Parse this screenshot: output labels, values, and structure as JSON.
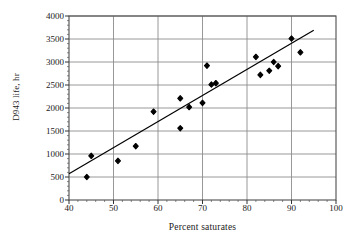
{
  "chart_data": {
    "type": "scatter",
    "title": "",
    "xlabel": "Percent saturates",
    "ylabel": "D943 life, hr",
    "xlim": [
      40,
      100
    ],
    "ylim": [
      0,
      4000
    ],
    "xticks": [
      40,
      50,
      60,
      70,
      80,
      90,
      100
    ],
    "yticks": [
      0,
      500,
      1000,
      1500,
      2000,
      2500,
      3000,
      3500,
      4000
    ],
    "grid": "horizontal-and-vertical",
    "legend": "none",
    "marker": "filled-diamond",
    "marker_color": "#000000",
    "line_color": "#000000",
    "points": [
      {
        "x": 44,
        "y": 500
      },
      {
        "x": 45,
        "y": 960
      },
      {
        "x": 51,
        "y": 850
      },
      {
        "x": 55,
        "y": 1170
      },
      {
        "x": 59,
        "y": 1920
      },
      {
        "x": 65,
        "y": 1560
      },
      {
        "x": 65,
        "y": 2210
      },
      {
        "x": 67,
        "y": 2020
      },
      {
        "x": 70,
        "y": 2110
      },
      {
        "x": 71,
        "y": 2920
      },
      {
        "x": 72,
        "y": 2510
      },
      {
        "x": 73,
        "y": 2540
      },
      {
        "x": 82,
        "y": 3110
      },
      {
        "x": 83,
        "y": 2720
      },
      {
        "x": 85,
        "y": 2810
      },
      {
        "x": 86,
        "y": 3000
      },
      {
        "x": 87,
        "y": 2910
      },
      {
        "x": 90,
        "y": 3510
      },
      {
        "x": 92,
        "y": 3210
      }
    ],
    "trendline": {
      "x_start": 40,
      "y_start": 570,
      "x_end": 95,
      "y_end": 3690
    }
  }
}
